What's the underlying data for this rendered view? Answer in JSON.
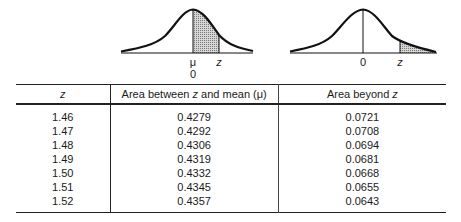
{
  "figures": {
    "left": {
      "shaded_region": "between mean and z",
      "labels": {
        "mean_symbol": "μ",
        "zero": "0",
        "z": "z"
      }
    },
    "right": {
      "shaded_region": "beyond z",
      "labels": {
        "zero": "0",
        "z": "z"
      }
    },
    "shade_color": "#b8b8b8",
    "line_color": "#111111"
  },
  "table": {
    "headers": {
      "z": "z",
      "between_prefix": "Area between ",
      "between_z": "z",
      "between_suffix": " and mean (μ)",
      "beyond_prefix": "Area beyond ",
      "beyond_z": "z"
    },
    "rows": [
      {
        "z": "1.46",
        "between": "0.4279",
        "beyond": "0.0721"
      },
      {
        "z": "1.47",
        "between": "0.4292",
        "beyond": "0.0708"
      },
      {
        "z": "1.48",
        "between": "0.4306",
        "beyond": "0.0694"
      },
      {
        "z": "1.49",
        "between": "0.4319",
        "beyond": "0.0681"
      },
      {
        "z": "1.50",
        "between": "0.4332",
        "beyond": "0.0668"
      },
      {
        "z": "1.51",
        "between": "0.4345",
        "beyond": "0.0655"
      },
      {
        "z": "1.52",
        "between": "0.4357",
        "beyond": "0.0643"
      }
    ]
  }
}
